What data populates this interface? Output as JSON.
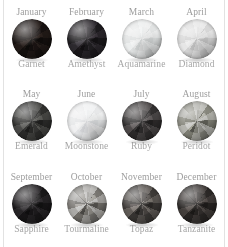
{
  "page": {
    "background_color": "#ffffff",
    "rule_color": "#e2e2e2",
    "month_text_color": "#9d9d9d",
    "gem_text_color": "#a6a6a6"
  },
  "rows": [
    {
      "cells": [
        {
          "month": "January",
          "gem": "Garnet",
          "gem_color": "#1b1513",
          "gem_tone": "dark"
        },
        {
          "month": "February",
          "gem": "Amethyst",
          "gem_color": "#232024",
          "gem_tone": "dark"
        },
        {
          "month": "March",
          "gem": "Aquamarine",
          "gem_color": "#e6e8e8",
          "gem_tone": "light"
        },
        {
          "month": "April",
          "gem": "Diamond",
          "gem_color": "#dedede",
          "gem_tone": "light"
        }
      ]
    },
    {
      "cells": [
        {
          "month": "May",
          "gem": "Emerald",
          "gem_color": "#3a3a38",
          "gem_tone": "dark"
        },
        {
          "month": "June",
          "gem": "Moonstone",
          "gem_color": "#ebeced",
          "gem_tone": "light"
        },
        {
          "month": "July",
          "gem": "Ruby",
          "gem_color": "#3d3a3a",
          "gem_tone": "medium"
        },
        {
          "month": "August",
          "gem": "Peridot",
          "gem_color": "#9a9a92",
          "gem_tone": "medium"
        }
      ]
    },
    {
      "cells": [
        {
          "month": "September",
          "gem": "Sapphire",
          "gem_color": "#1f1d1f",
          "gem_tone": "dark"
        },
        {
          "month": "October",
          "gem": "Tourmaline",
          "gem_color": "#8e8c88",
          "gem_tone": "medium"
        },
        {
          "month": "November",
          "gem": "Topaz",
          "gem_color": "#4c4845",
          "gem_tone": "medium"
        },
        {
          "month": "December",
          "gem": "Tanzanite",
          "gem_color": "#35312f",
          "gem_tone": "dark"
        }
      ]
    }
  ]
}
